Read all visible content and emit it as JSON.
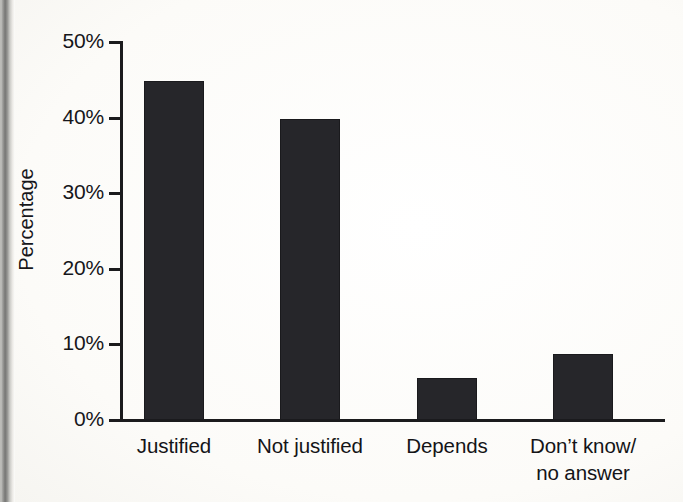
{
  "figure": {
    "background_color": "#fdfdfb",
    "bar_color": "#26262a",
    "axis_color": "#1b1b1d",
    "text_color": "#16161a"
  },
  "axes": {
    "y_axis_title": "Percentage",
    "y_tick_labels": [
      "50%",
      "40%",
      "30%",
      "20%",
      "10%",
      "0%"
    ],
    "x_tick_labels": [
      "Justified",
      "Not justified",
      "Depends",
      "Don’t know/\nno answer"
    ]
  },
  "chart_data": {
    "type": "bar",
    "title": "",
    "subtitle": "",
    "xlabel": "",
    "ylabel": "Percentage",
    "categories": [
      "Justified",
      "Not justified",
      "Depends",
      "Don’t know/no answer"
    ],
    "values": [
      44.8,
      39.8,
      5.6,
      8.7
    ],
    "value_labels": [
      "45%",
      "40%",
      "5.6%",
      "8.7%"
    ],
    "ylim": [
      0,
      50
    ],
    "yticks": [
      0,
      10,
      20,
      30,
      40,
      50
    ],
    "ytick_labels": [
      "0%",
      "10%",
      "20%",
      "30%",
      "40%",
      "50%"
    ],
    "grid": false,
    "legend": false,
    "legend_position": "none",
    "series": [
      {
        "name": "Percentage",
        "values": [
          44.8,
          39.8,
          5.6,
          8.7
        ],
        "color": "#26262a"
      }
    ]
  }
}
